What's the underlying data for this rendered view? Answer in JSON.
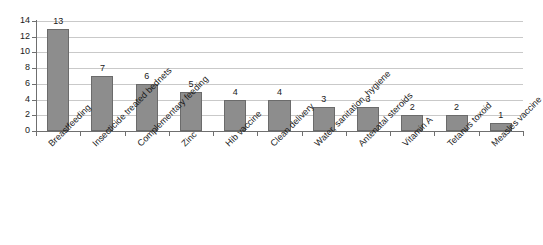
{
  "chart_data": {
    "type": "bar",
    "title": "",
    "subtitle": "",
    "xlabel": "",
    "ylabel": "",
    "ylim": [
      0,
      14
    ],
    "ytick_step": 2,
    "yticks": [
      0,
      2,
      4,
      6,
      8,
      10,
      12,
      14
    ],
    "grid": true,
    "legend": false,
    "legend_position": "none",
    "bar_color": "#8d8d8d",
    "bar_border_color": "#6b6b6b",
    "gridline_color": "#c9c9c9",
    "axis_color": "#6f6f6f",
    "label_rotation_deg": -45,
    "show_value_labels": true,
    "categories": [
      "Breastfeeding",
      "Insecticide treated bednets",
      "Complementary feeding",
      "Zinc",
      "Hib vaccine",
      "Clean delivery",
      "Water, sanitation, hygiene",
      "Antenatal steroids",
      "Vitamin A",
      "Tetanus toxoid",
      "Measles vaccine"
    ],
    "values": [
      13,
      7,
      6,
      5,
      4,
      4,
      3,
      3,
      2,
      2,
      1
    ],
    "value_labels": [
      "13",
      "7",
      "6",
      "5",
      "4",
      "4",
      "3",
      "3",
      "2",
      "2",
      "1"
    ],
    "ytick_labels": [
      "0",
      "2",
      "4",
      "6",
      "8",
      "10",
      "12",
      "14"
    ]
  }
}
